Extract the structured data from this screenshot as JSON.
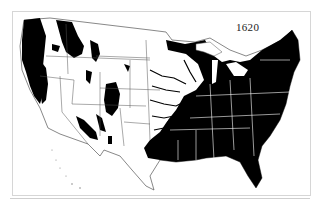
{
  "map": {
    "title_year": "1620",
    "subject": "Extent of forest cover, contiguous United States",
    "colors": {
      "forest": "#000000",
      "land": "#ffffff",
      "boundary_on_land": "#555555",
      "boundary_on_forest": "#ffffff",
      "frame": "#d6d6d6"
    },
    "legend": {
      "forest_label": "",
      "nonforest_label": ""
    }
  }
}
